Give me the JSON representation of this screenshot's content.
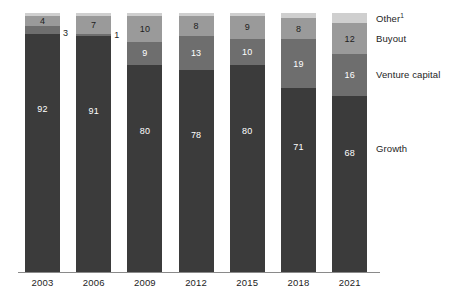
{
  "chart_data": {
    "type": "bar",
    "subtype": "stacked-100-percent-column",
    "title": "",
    "subtitle": "",
    "xlabel": "",
    "ylabel": "",
    "ylim": [
      0,
      100
    ],
    "grid": false,
    "legend_position": "right",
    "categories": [
      "2003",
      "2006",
      "2009",
      "2012",
      "2015",
      "2018",
      "2021"
    ],
    "series": [
      {
        "name": "Growth",
        "color": "#3b3b3b",
        "values": [
          92,
          91,
          80,
          78,
          80,
          71,
          68
        ],
        "labels": [
          "92",
          "91",
          "80",
          "78",
          "80",
          "71",
          "68"
        ]
      },
      {
        "name": "Venture capital",
        "color": "#6e6e6e",
        "values": [
          3,
          1,
          9,
          13,
          10,
          19,
          16
        ],
        "labels": [
          "3",
          "1",
          "9",
          "13",
          "10",
          "19",
          "16"
        ]
      },
      {
        "name": "Buyout",
        "color": "#9a9a9a",
        "values": [
          4,
          7,
          10,
          8,
          9,
          8,
          12
        ],
        "labels": [
          "4",
          "7",
          "10",
          "8",
          "9",
          "8",
          "12"
        ]
      },
      {
        "name": "Other",
        "color": "#cfcfcf",
        "values": [
          1,
          1,
          1,
          1,
          1,
          2,
          4
        ],
        "labels": [
          "",
          "",
          "",
          "",
          "",
          "",
          ""
        ]
      }
    ],
    "legend": [
      {
        "label": "Other",
        "footnote": "1",
        "color": "#cfcfcf"
      },
      {
        "label": "Buyout",
        "footnote": "",
        "color": "#9a9a9a"
      },
      {
        "label": "Venture capital",
        "footnote": "",
        "color": "#6e6e6e"
      },
      {
        "label": "Growth",
        "footnote": "",
        "color": "#3b3b3b"
      }
    ]
  },
  "axis": {
    "ticks": [
      "2003",
      "2006",
      "2009",
      "2012",
      "2015",
      "2018",
      "2021"
    ]
  },
  "legend_labels": {
    "other": "Other",
    "other_footnote": "1",
    "buyout": "Buyout",
    "venture_capital": "Venture capital",
    "growth": "Growth"
  }
}
